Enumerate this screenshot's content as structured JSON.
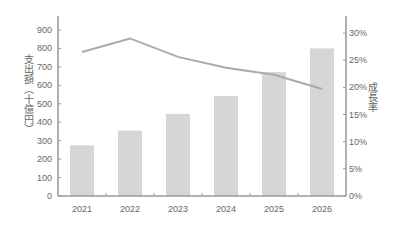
{
  "chart_data": {
    "type": "bar+line",
    "title": "",
    "categories": [
      "2021",
      "2022",
      "2023",
      "2024",
      "2025",
      "2026"
    ],
    "series": [
      {
        "name": "支出額（十億円）",
        "type": "bar",
        "axis": "left",
        "values": [
          275,
          355,
          445,
          542,
          672,
          800
        ],
        "color": "#d6d6d6"
      },
      {
        "name": "成長率",
        "type": "line",
        "axis": "right",
        "values": [
          26.5,
          29.0,
          25.6,
          23.6,
          22.3,
          19.7
        ],
        "unit": "%",
        "color": "#aaaaaa"
      }
    ],
    "xlabel": "",
    "ylabel": "支出額（十億円）",
    "y2label": "成長率",
    "ylim": [
      0,
      900
    ],
    "y2lim": [
      0,
      30
    ],
    "yticks": [
      "0",
      "100",
      "200",
      "300",
      "400",
      "500",
      "600",
      "700",
      "800",
      "900"
    ],
    "y2ticks": [
      "0%",
      "5%",
      "10%",
      "15%",
      "20%",
      "25%",
      "30%"
    ],
    "grid": false,
    "legend": "none"
  },
  "colors": {
    "bar": "#d6d6d6",
    "line": "#aaaaaa",
    "axis": "#999999",
    "text": "#666666"
  }
}
